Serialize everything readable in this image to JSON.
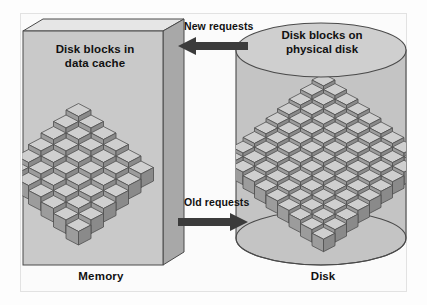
{
  "diagram": {
    "title_semantic": "disk-block-cache-diagram",
    "memory": {
      "box_label": "Disk blocks in\ndata cache",
      "box_label_line1": "Disk blocks in",
      "box_label_line2": "data cache",
      "caption": "Memory",
      "block_count": 36,
      "grid_cols": 6,
      "grid_rows": 6
    },
    "disk": {
      "cylinder_label_line1": "Disk blocks on",
      "cylinder_label_line2": "physical disk",
      "caption": "Disk",
      "block_count": 81,
      "grid_cols": 9,
      "grid_rows": 9
    },
    "arrows": [
      {
        "id": "new-requests",
        "label": "New requests",
        "direction": "left",
        "from": "Disk",
        "to": "Memory"
      },
      {
        "id": "old-requests",
        "label": "Old requests",
        "direction": "right",
        "from": "Memory",
        "to": "Disk"
      }
    ],
    "colors": {
      "frame_border": "#e2e2e2",
      "page_background": "#fdfdfd",
      "panel_fill": "#c9c9c9",
      "panel_top_fill": "#e6e6e6",
      "panel_side_fill": "#a8a8a8",
      "panel_stroke": "#4a4a4a",
      "cylinder_fill": "#c4c4c4",
      "cylinder_top_fill": "#cfcfcf",
      "cylinder_stroke": "#4a4a4a",
      "cube_top": "#cfcfcf",
      "cube_left": "#9c9c9c",
      "cube_right": "#8a8a8a",
      "cube_stroke": "#4f4f4f",
      "arrow_fill": "#3b3b3b",
      "text": "#111111"
    }
  }
}
